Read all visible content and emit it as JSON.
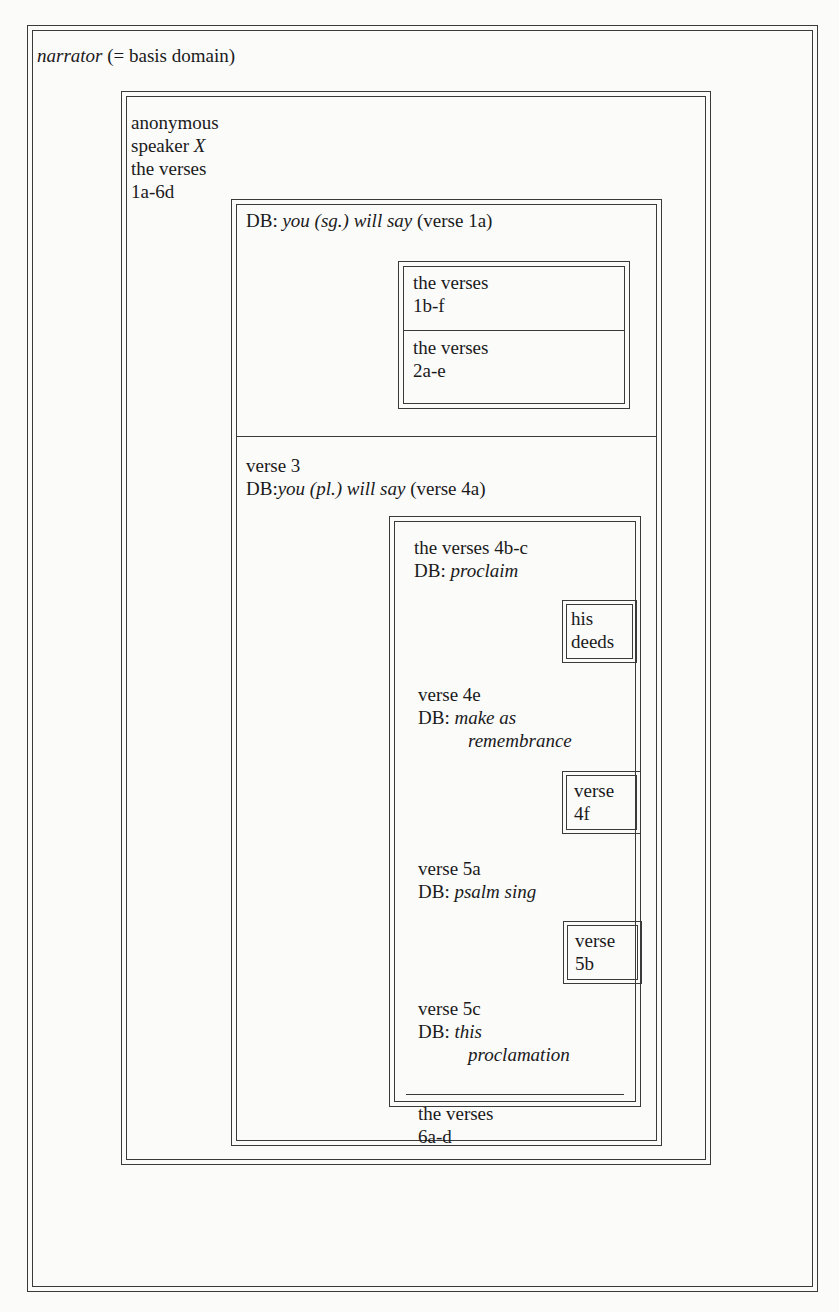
{
  "diagram": {
    "outer": {
      "label_italic": "narrator",
      "label_rest": " (= basis domain)"
    },
    "speaker": {
      "lines": [
        "anonymous",
        "speaker ",
        "the verses",
        "1a-6d"
      ],
      "speaker_italic": "X"
    },
    "db1": {
      "prefix": "DB: ",
      "italic": "you (sg.) will say",
      "suffix": " (verse 1a)",
      "cells": [
        {
          "line1": "the verses",
          "line2": "1b-f"
        },
        {
          "line1": "the verses",
          "line2": "2a-e"
        }
      ]
    },
    "db2": {
      "line1": "verse 3",
      "prefix": "DB:",
      "italic": "you (pl.) will say",
      "suffix": " (verse 4a)",
      "inner": {
        "sections": [
          {
            "line1": "the verses 4b-c",
            "db_prefix": "DB: ",
            "db_italic": [
              "proclaim"
            ],
            "box": [
              "his",
              "deeds"
            ]
          },
          {
            "line1": "verse 4e",
            "db_prefix": "DB: ",
            "db_italic": [
              "make as",
              "remembrance"
            ],
            "box": [
              "verse",
              "4f"
            ]
          },
          {
            "line1": "verse 5a",
            "db_prefix": "DB: ",
            "db_italic": [
              "psalm sing"
            ],
            "box": [
              "verse",
              "5b"
            ]
          },
          {
            "line1": "verse 5c",
            "db_prefix": "DB: ",
            "db_italic": [
              "this",
              "proclamation"
            ]
          }
        ],
        "footer": {
          "line1": "the verses",
          "line2": "6a-d"
        }
      }
    }
  }
}
